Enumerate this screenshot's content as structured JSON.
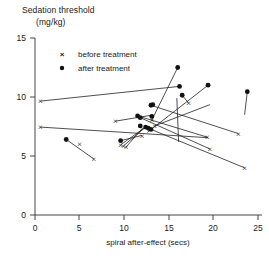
{
  "chart_data": {
    "type": "scatter",
    "title": "Sedation threshold",
    "title_line2": "(mg/kg)",
    "xlabel": "spiral after-effect (secs)",
    "ylabel": "Sedation threshold (mg/kg)",
    "xlim": [
      0,
      25
    ],
    "ylim": [
      0,
      15
    ],
    "xticks": [
      0,
      5,
      10,
      15,
      20,
      25
    ],
    "yticks": [
      0,
      5,
      10,
      15
    ],
    "grid": false,
    "legend_position": "top-left",
    "legend": [
      {
        "marker": "x",
        "label": "before treatment"
      },
      {
        "marker": "dot",
        "label": "after treatment"
      }
    ],
    "series": [
      {
        "name": "before treatment",
        "marker": "x",
        "points": [
          [
            0.6,
            9.65
          ],
          [
            0.6,
            7.45
          ],
          [
            5.0,
            6.05
          ],
          [
            6.6,
            4.75
          ],
          [
            9.0,
            7.95
          ],
          [
            9.6,
            5.95
          ],
          [
            9.9,
            5.85
          ],
          [
            10.2,
            5.75
          ],
          [
            12.0,
            6.75
          ],
          [
            13.1,
            8.05
          ],
          [
            13.4,
            7.55
          ],
          [
            17.2,
            9.5
          ],
          [
            19.3,
            6.6
          ],
          [
            19.6,
            5.6
          ],
          [
            22.8,
            6.9
          ],
          [
            23.5,
            4.0
          ]
        ]
      },
      {
        "name": "after treatment",
        "marker": "dot",
        "points": [
          [
            16.2,
            10.9
          ],
          [
            13.0,
            9.3
          ],
          [
            3.5,
            6.4
          ],
          [
            9.6,
            6.3
          ],
          [
            11.8,
            7.55
          ],
          [
            12.4,
            7.45
          ],
          [
            12.7,
            7.35
          ],
          [
            13.0,
            7.25
          ],
          [
            13.1,
            8.35
          ],
          [
            16.0,
            12.5
          ],
          [
            16.5,
            10.15
          ],
          [
            19.4,
            11.0
          ],
          [
            13.2,
            9.35
          ],
          [
            11.5,
            8.4
          ],
          [
            11.8,
            8.25
          ],
          [
            23.8,
            10.45
          ]
        ]
      },
      {
        "name": "pairs",
        "marker": "line",
        "pairs": [
          {
            "before": [
              0.6,
              9.65
            ],
            "after": [
              16.2,
              10.9
            ]
          },
          {
            "before": [
              0.6,
              7.45
            ],
            "after": [
              19.4,
              6.55
            ]
          },
          {
            "before": [
              9.0,
              7.95
            ],
            "after": [
              13.0,
              8.45
            ]
          },
          {
            "before": [
              6.6,
              4.75
            ],
            "after": [
              3.5,
              6.4
            ]
          },
          {
            "before": [
              12.0,
              6.75
            ],
            "after": [
              9.6,
              6.3
            ]
          },
          {
            "before": [
              13.1,
              8.05
            ],
            "after": [
              16.0,
              12.5
            ]
          },
          {
            "before": [
              13.4,
              7.55
            ],
            "after": [
              19.6,
              9.35
            ]
          },
          {
            "before": [
              17.2,
              9.5
            ],
            "after": [
              16.5,
              10.15
            ]
          },
          {
            "before": [
              19.3,
              6.6
            ],
            "after": [
              11.5,
              8.4
            ]
          },
          {
            "before": [
              19.6,
              5.6
            ],
            "after": [
              11.8,
              8.25
            ]
          },
          {
            "before": [
              22.8,
              6.9
            ],
            "after": [
              13.0,
              9.3
            ]
          },
          {
            "before": [
              23.5,
              4.0
            ],
            "after": [
              12.7,
              7.35
            ]
          },
          {
            "before": [
              23.5,
              8.5
            ],
            "after": [
              23.8,
              10.45
            ]
          },
          {
            "before": [
              9.6,
              5.95
            ],
            "after": [
              12.4,
              7.45
            ]
          },
          {
            "before": [
              9.9,
              5.85
            ],
            "after": [
              12.4,
              7.45
            ]
          },
          {
            "before": [
              10.2,
              5.75
            ],
            "after": [
              12.1,
              7.4
            ]
          },
          {
            "before": [
              16.1,
              6.2
            ],
            "after": [
              15.9,
              9.9
            ]
          },
          {
            "before": [
              12.6,
              7.0
            ],
            "after": [
              19.4,
              11.0
            ]
          }
        ]
      }
    ]
  }
}
